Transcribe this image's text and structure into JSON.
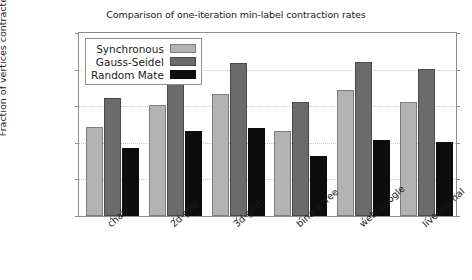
{
  "chart_data": {
    "type": "bar",
    "title": "Comparison of one-iteration min-label contraction rates",
    "xlabel": "",
    "ylabel": "Fraction of vertices contracted",
    "ylim": [
      0,
      1
    ],
    "ytick_labels": [
      "0",
      "0.2",
      "0.4",
      "0.6",
      "0.8",
      "1"
    ],
    "ytick_values": [
      0,
      0.2,
      0.4,
      0.6,
      0.8,
      1
    ],
    "grid": true,
    "legend_position": "upper left",
    "categories": [
      "chain",
      "2d-grid",
      "3d-grid",
      "binary tree",
      "web-Google",
      "live-journal"
    ],
    "series": [
      {
        "name": "Synchronous",
        "color": "#b3b3b3",
        "values": [
          0.485,
          0.605,
          0.665,
          0.465,
          0.69,
          0.625
        ]
      },
      {
        "name": "Gauss-Seidel",
        "color": "#6b6b6b",
        "values": [
          0.645,
          0.785,
          0.835,
          0.625,
          0.84,
          0.805
        ]
      },
      {
        "name": "Random Mate",
        "color": "#0d0d0d",
        "values": [
          0.37,
          0.465,
          0.48,
          0.33,
          0.415,
          0.405
        ]
      }
    ]
  }
}
